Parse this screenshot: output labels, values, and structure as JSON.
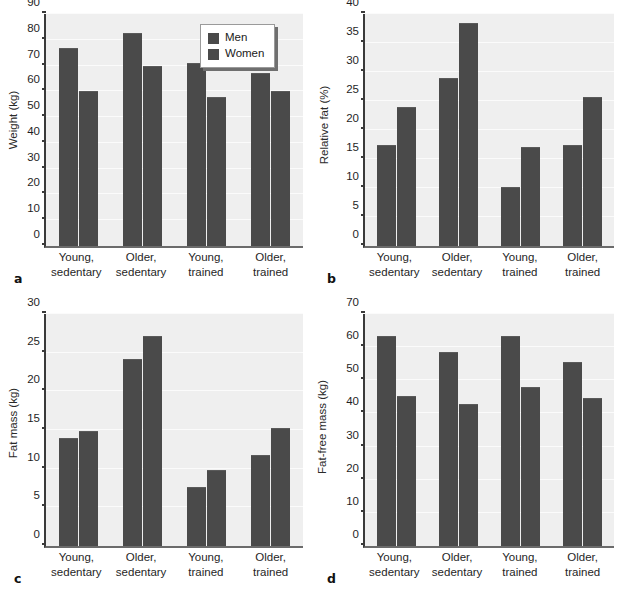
{
  "figure": {
    "categories": [
      {
        "line1": "Young,",
        "line2": "sedentary"
      },
      {
        "line1": "Older,",
        "line2": "sedentary"
      },
      {
        "line1": "Young,",
        "line2": "trained"
      },
      {
        "line1": "Older,",
        "line2": "trained"
      }
    ],
    "legend": {
      "men_label": "Men",
      "women_label": "Women",
      "men_color": "#4a4a4a",
      "women_color": "#4a4a4a"
    },
    "colors": {
      "bar": "#4a4a4a",
      "plot_background": "#efefef",
      "gridline": "#fbfbfb",
      "axis": "#3a3a3a"
    },
    "panel_letters": {
      "a": "a",
      "b": "b",
      "c": "c",
      "d": "d"
    }
  },
  "chart_data": [
    {
      "panel": "a",
      "type": "bar",
      "title": "",
      "ylabel": "Weight (kg)",
      "xlabel": "",
      "ylim": [
        0,
        90
      ],
      "yticks": [
        0,
        10,
        20,
        30,
        40,
        50,
        60,
        70,
        80,
        90
      ],
      "ytick_labels": [
        "0",
        "10",
        "20",
        "30",
        "40",
        "50",
        "60",
        "70",
        "80",
        "90"
      ],
      "grid": true,
      "legend_position": "top-right",
      "categories": [
        "Young, sedentary",
        "Older, sedentary",
        "Young, trained",
        "Older, trained"
      ],
      "series": [
        {
          "name": "Men",
          "values": [
            77.0,
            82.7,
            71.0,
            67.3
          ]
        },
        {
          "name": "Women",
          "values": [
            60.0,
            70.0,
            58.0,
            60.0
          ]
        }
      ]
    },
    {
      "panel": "b",
      "type": "bar",
      "title": "",
      "ylabel": "Relative fat (%)",
      "xlabel": "",
      "ylim": [
        0,
        40
      ],
      "yticks": [
        0,
        5,
        10,
        15,
        20,
        25,
        30,
        35,
        40
      ],
      "ytick_labels": [
        "0",
        "5",
        "10",
        "15",
        "20",
        "25",
        "30",
        "35",
        "40"
      ],
      "grid": true,
      "legend_position": "none",
      "categories": [
        "Young, sedentary",
        "Older, sedentary",
        "Young, trained",
        "Older, trained"
      ],
      "series": [
        {
          "name": "Men",
          "values": [
            17.5,
            28.9,
            10.2,
            17.4
          ]
        },
        {
          "name": "Women",
          "values": [
            24.0,
            38.5,
            17.0,
            25.7
          ]
        }
      ]
    },
    {
      "panel": "c",
      "type": "bar",
      "title": "",
      "ylabel": "Fat mass (kg)",
      "xlabel": "",
      "ylim": [
        0,
        30
      ],
      "yticks": [
        0,
        5,
        10,
        15,
        20,
        25,
        30
      ],
      "ytick_labels": [
        "0",
        "5",
        "10",
        "15",
        "20",
        "25",
        "30"
      ],
      "grid": true,
      "legend_position": "none",
      "categories": [
        "Young, sedentary",
        "Older, sedentary",
        "Young, trained",
        "Older, trained"
      ],
      "series": [
        {
          "name": "Men",
          "values": [
            14.0,
            24.2,
            7.6,
            11.8
          ]
        },
        {
          "name": "Women",
          "values": [
            14.9,
            27.1,
            9.8,
            15.3
          ]
        }
      ]
    },
    {
      "panel": "d",
      "type": "bar",
      "title": "",
      "ylabel": "Fat-free mass (kg)",
      "xlabel": "",
      "ylim": [
        0,
        70
      ],
      "yticks": [
        0,
        10,
        20,
        30,
        40,
        50,
        60,
        70
      ],
      "ytick_labels": [
        "0",
        "10",
        "20",
        "30",
        "40",
        "50",
        "60",
        "70"
      ],
      "grid": true,
      "legend_position": "none",
      "categories": [
        "Young, sedentary",
        "Older, sedentary",
        "Young, trained",
        "Older, trained"
      ],
      "series": [
        {
          "name": "Men",
          "values": [
            63.5,
            58.6,
            63.4,
            55.5
          ]
        },
        {
          "name": "Women",
          "values": [
            45.2,
            42.7,
            48.1,
            44.6
          ]
        }
      ]
    }
  ]
}
